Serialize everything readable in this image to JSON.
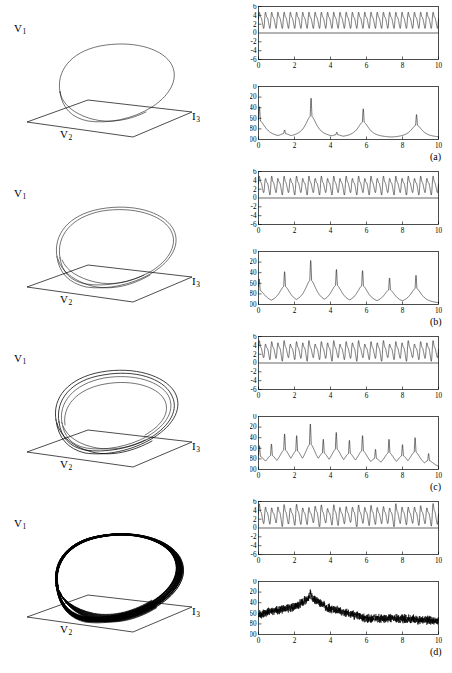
{
  "figure": {
    "panels": [
      {
        "id": "a",
        "letter": "(a)"
      },
      {
        "id": "b",
        "letter": "(b)"
      },
      {
        "id": "c",
        "letter": "(c)"
      },
      {
        "id": "d",
        "letter": "(d)"
      }
    ]
  },
  "portrait_axes": {
    "vertical": "V",
    "vertical_sub": "1",
    "horizontal1": "V",
    "horizontal1_sub": "2",
    "horizontal2": "I",
    "horizontal2_sub": "3"
  },
  "chart_data": [
    {
      "id": "a-timeseries",
      "type": "line",
      "title": "",
      "xlabel": "",
      "ylabel": "",
      "xlim": [
        0,
        10
      ],
      "ylim": [
        -6,
        6
      ],
      "xticks": [
        0,
        2,
        4,
        6,
        8,
        10
      ],
      "yticks": [
        -6,
        -4,
        -2,
        0,
        2,
        4,
        6
      ],
      "grid": false,
      "waveform": "periodic period-1 oscillation",
      "cycles": 29,
      "amplitude_min": 0.9,
      "amplitude_max": 5.0,
      "baseline": 0
    },
    {
      "id": "a-spectrum",
      "type": "line",
      "title": "",
      "xlabel": "",
      "ylabel": "",
      "xlim": [
        0,
        10
      ],
      "ylim": [
        -100,
        0
      ],
      "xticks": [
        0,
        2,
        4,
        6,
        8,
        10
      ],
      "yticks": [
        -100,
        -80,
        -60,
        -40,
        -20,
        0
      ],
      "grid": false,
      "peaks": [
        {
          "x": 0.05,
          "y": -38
        },
        {
          "x": 1.45,
          "y": -82
        },
        {
          "x": 2.92,
          "y": -22
        },
        {
          "x": 4.35,
          "y": -86
        },
        {
          "x": 5.82,
          "y": -42
        },
        {
          "x": 8.78,
          "y": -53
        }
      ],
      "noise_floor": -97,
      "character": "discrete harmonic peaks"
    },
    {
      "id": "b-timeseries",
      "type": "line",
      "title": "",
      "xlabel": "",
      "ylabel": "",
      "xlim": [
        0,
        10
      ],
      "ylim": [
        -6,
        6
      ],
      "xticks": [
        0,
        2,
        4,
        6,
        8,
        10
      ],
      "yticks": [
        -6,
        -4,
        -2,
        0,
        2,
        4,
        6
      ],
      "grid": false,
      "waveform": "period-2 oscillation with alternating amplitudes",
      "cycles": 29,
      "amplitude_min": 0.8,
      "amplitude_max": 5.0,
      "baseline": 0
    },
    {
      "id": "b-spectrum",
      "type": "line",
      "title": "",
      "xlabel": "",
      "ylabel": "",
      "xlim": [
        0,
        10
      ],
      "ylim": [
        -100,
        0
      ],
      "xticks": [
        0,
        2,
        4,
        6,
        8,
        10
      ],
      "yticks": [
        -100,
        -80,
        -60,
        -40,
        -20,
        0
      ],
      "grid": false,
      "peaks": [
        {
          "x": 0.04,
          "y": -52
        },
        {
          "x": 1.45,
          "y": -38
        },
        {
          "x": 2.9,
          "y": -17
        },
        {
          "x": 4.33,
          "y": -34
        },
        {
          "x": 5.78,
          "y": -36
        },
        {
          "x": 7.28,
          "y": -50
        },
        {
          "x": 8.75,
          "y": -45
        }
      ],
      "noise_floor": -99,
      "character": "fundamental plus subharmonic at half frequency"
    },
    {
      "id": "c-timeseries",
      "type": "line",
      "title": "",
      "xlabel": "",
      "ylabel": "",
      "xlim": [
        0,
        10
      ],
      "ylim": [
        -6,
        6
      ],
      "xticks": [
        0,
        2,
        4,
        6,
        8,
        10
      ],
      "yticks": [
        -6,
        -4,
        -2,
        0,
        2,
        4,
        6
      ],
      "grid": false,
      "waveform": "period-4 oscillation, four distinct peak heights",
      "cycles": 29,
      "amplitude_min": 0.7,
      "amplitude_max": 5.0,
      "baseline": 0
    },
    {
      "id": "c-spectrum",
      "type": "line",
      "title": "",
      "xlabel": "",
      "ylabel": "",
      "xlim": [
        0,
        10
      ],
      "ylim": [
        -100,
        0
      ],
      "xticks": [
        0,
        2,
        4,
        6,
        8,
        10
      ],
      "yticks": [
        -100,
        -80,
        -60,
        -40,
        -20,
        0
      ],
      "grid": false,
      "peaks": [
        {
          "x": 0.05,
          "y": -55
        },
        {
          "x": 0.72,
          "y": -52
        },
        {
          "x": 1.45,
          "y": -33
        },
        {
          "x": 2.12,
          "y": -36
        },
        {
          "x": 2.88,
          "y": -14
        },
        {
          "x": 3.6,
          "y": -43
        },
        {
          "x": 4.32,
          "y": -30
        },
        {
          "x": 5.05,
          "y": -45
        },
        {
          "x": 5.78,
          "y": -36
        },
        {
          "x": 6.5,
          "y": -62
        },
        {
          "x": 7.25,
          "y": -43
        },
        {
          "x": 8.0,
          "y": -53
        },
        {
          "x": 8.7,
          "y": -40
        },
        {
          "x": 9.45,
          "y": -70
        }
      ],
      "noise_floor": -99,
      "character": "quarter-frequency subharmonics between harmonics"
    },
    {
      "id": "d-timeseries",
      "type": "line",
      "title": "",
      "xlabel": "",
      "ylabel": "",
      "xlim": [
        0,
        10
      ],
      "ylim": [
        -6,
        6
      ],
      "xticks": [
        0,
        2,
        4,
        6,
        8,
        10
      ],
      "yticks": [
        -6,
        -4,
        -2,
        0,
        2,
        4,
        6
      ],
      "grid": false,
      "waveform": "chaotic aperiodic oscillation with irregular amplitudes",
      "cycles": 29,
      "amplitude_min": 0.6,
      "amplitude_max": 5.2,
      "baseline": 0
    },
    {
      "id": "d-spectrum",
      "type": "line",
      "title": "",
      "xlabel": "",
      "ylabel": "",
      "xlim": [
        0,
        10
      ],
      "ylim": [
        -100,
        0
      ],
      "xticks": [
        0,
        2,
        4,
        6,
        8,
        10
      ],
      "yticks": [
        -100,
        -80,
        -60,
        -40,
        -20,
        0
      ],
      "grid": false,
      "peaks": [
        {
          "x": 2.88,
          "y": -22
        }
      ],
      "broadband_envelope": [
        {
          "x": 0.0,
          "y": -62
        },
        {
          "x": 1.0,
          "y": -55
        },
        {
          "x": 2.0,
          "y": -48
        },
        {
          "x": 2.9,
          "y": -30
        },
        {
          "x": 4.0,
          "y": -52
        },
        {
          "x": 5.0,
          "y": -60
        },
        {
          "x": 6.0,
          "y": -70
        },
        {
          "x": 8.0,
          "y": -70
        },
        {
          "x": 10.0,
          "y": -75
        }
      ],
      "noise_floor": -85,
      "character": "broadband continuous chaotic spectrum"
    }
  ],
  "colors": {
    "line": "#000000",
    "background": "#ffffff",
    "axis": "#000000"
  }
}
